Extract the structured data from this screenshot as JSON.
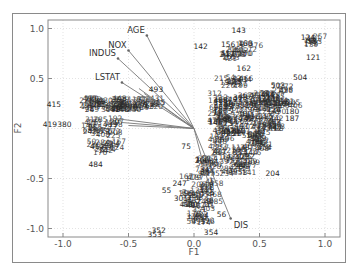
{
  "chart_data": {
    "type": "scatter",
    "subtype": "biplot",
    "title": "",
    "xlabel": "F1",
    "ylabel": "F2",
    "xlim": [
      -1.1,
      1.12
    ],
    "ylim": [
      -1.08,
      1.1
    ],
    "xticks": [
      "-1.0",
      "-0.5",
      "0.0",
      "0.5",
      "1.0"
    ],
    "xtick_values": [
      -1.0,
      -0.5,
      0.0,
      0.5,
      1.0
    ],
    "yticks": [
      "1.0",
      "0.5",
      "-0.5",
      "-1.0"
    ],
    "ytick_values": [
      1.0,
      0.5,
      -0.5,
      -1.0
    ],
    "grid": true,
    "legend": null,
    "variable_vectors": [
      {
        "name": "AGE",
        "x": -0.36,
        "y": 0.93
      },
      {
        "name": "NOX",
        "x": -0.5,
        "y": 0.78
      },
      {
        "name": "INDUS",
        "x": -0.58,
        "y": 0.7
      },
      {
        "name": "LSTAT",
        "x": -0.55,
        "y": 0.46
      },
      {
        "name": "DIS",
        "x": 0.28,
        "y": -0.9
      }
    ],
    "unlabeled_vectors": [
      {
        "x": -0.42,
        "y": 0.4
      },
      {
        "x": -0.38,
        "y": 0.35
      },
      {
        "x": -0.6,
        "y": 0.1
      },
      {
        "x": -0.55,
        "y": 0.06
      },
      {
        "x": -0.5,
        "y": 0.03
      },
      {
        "x": 0.12,
        "y": -0.6
      }
    ],
    "labeled_points": [
      {
        "label": "143",
        "x": 0.34,
        "y": 0.96
      },
      {
        "label": "142",
        "x": 0.05,
        "y": 0.8
      },
      {
        "label": "121",
        "x": 0.91,
        "y": 0.69
      },
      {
        "label": "124",
        "x": 0.87,
        "y": 0.89
      },
      {
        "label": "156",
        "x": 0.26,
        "y": 0.82
      },
      {
        "label": "160",
        "x": 0.39,
        "y": 0.83
      },
      {
        "label": "162",
        "x": 0.38,
        "y": 0.58
      },
      {
        "label": "504",
        "x": 0.81,
        "y": 0.49
      },
      {
        "label": "503",
        "x": 0.64,
        "y": 0.41
      },
      {
        "label": "181",
        "x": 0.71,
        "y": 0.25
      },
      {
        "label": "180",
        "x": 0.75,
        "y": 0.15
      },
      {
        "label": "187",
        "x": 0.75,
        "y": 0.08
      },
      {
        "label": "274",
        "x": 0.58,
        "y": -0.01
      },
      {
        "label": "204",
        "x": 0.6,
        "y": -0.47
      },
      {
        "label": "283",
        "x": 0.5,
        "y": -0.12
      },
      {
        "label": "282",
        "x": 0.41,
        "y": -0.3
      },
      {
        "label": "415",
        "x": -1.07,
        "y": 0.22
      },
      {
        "label": "419",
        "x": -1.1,
        "y": 0.02
      },
      {
        "label": "380",
        "x": -0.99,
        "y": 0.02
      },
      {
        "label": "484",
        "x": -0.75,
        "y": -0.38
      },
      {
        "label": "493",
        "x": -0.29,
        "y": 0.37
      },
      {
        "label": "55",
        "x": -0.21,
        "y": -0.64
      },
      {
        "label": "352",
        "x": -0.27,
        "y": -1.04
      },
      {
        "label": "353",
        "x": -0.3,
        "y": -1.08
      },
      {
        "label": "354",
        "x": 0.13,
        "y": -1.06
      },
      {
        "label": "56",
        "x": 0.21,
        "y": -0.88
      },
      {
        "label": "75",
        "x": -0.06,
        "y": -0.2
      },
      {
        "label": "247",
        "x": -0.11,
        "y": -0.57
      },
      {
        "label": "301",
        "x": -0.1,
        "y": -0.72
      }
    ]
  },
  "axes": {
    "xlabel": "F1",
    "ylabel": "F2",
    "xtick_labels": [
      "-1.0",
      "-0.5",
      "0.0",
      "0.5",
      "1.0"
    ],
    "ytick_labels": [
      "1.0",
      "0.5",
      "-0.5",
      "-1.0"
    ]
  }
}
